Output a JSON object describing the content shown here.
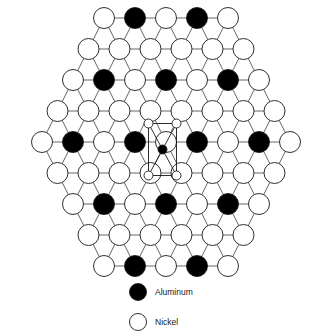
{
  "figure": {
    "background_color": "#ffffff",
    "width": 332,
    "height": 336
  },
  "colors": {
    "aluminum_fill": "#000000",
    "nickel_fill": "#ffffff",
    "atom_stroke": "#1a1a1a",
    "bond_stroke": "#555555",
    "unit_cell_stroke": "#1a1a1a"
  },
  "lattice": {
    "geometry": {
      "center_x": 166,
      "center_y": 142,
      "column_spacing": 31,
      "row_spacing": 31,
      "atom_radius": 10.5,
      "bond_width": 0.9,
      "atom_stroke_width": 0.9
    },
    "legend_keys": {
      "aluminum": "Al",
      "nickel": "Ni"
    },
    "rows": [
      {
        "index": 0,
        "y": 18,
        "offset": 0.0,
        "count": 5,
        "species": [
          "Ni",
          "Al",
          "Ni",
          "Al",
          "Ni"
        ]
      },
      {
        "index": 1,
        "y": 49,
        "offset": 0.5,
        "count": 6,
        "species": [
          "Ni",
          "Ni",
          "Ni",
          "Ni",
          "Ni",
          "Ni"
        ]
      },
      {
        "index": 2,
        "y": 80,
        "offset": 0.0,
        "count": 7,
        "species": [
          "Ni",
          "Al",
          "Ni",
          "Al",
          "Ni",
          "Al",
          "Ni"
        ]
      },
      {
        "index": 3,
        "y": 111,
        "offset": 0.5,
        "count": 8,
        "species": [
          "Ni",
          "Ni",
          "Ni",
          "Ni",
          "Ni",
          "Ni",
          "Ni",
          "Ni"
        ]
      },
      {
        "index": 4,
        "y": 142,
        "offset": 0.0,
        "count": 9,
        "species": [
          "Ni",
          "Al",
          "Ni",
          "Al",
          "Ni",
          "Al",
          "Ni",
          "Al",
          "Ni"
        ]
      },
      {
        "index": 5,
        "y": 173,
        "offset": 0.5,
        "count": 8,
        "species": [
          "Ni",
          "Ni",
          "Ni",
          "Ni",
          "Ni",
          "Ni",
          "Ni",
          "Ni"
        ]
      },
      {
        "index": 6,
        "y": 204,
        "offset": 0.0,
        "count": 7,
        "species": [
          "Ni",
          "Al",
          "Ni",
          "Al",
          "Ni",
          "Al",
          "Ni"
        ]
      },
      {
        "index": 7,
        "y": 235,
        "offset": 0.5,
        "count": 6,
        "species": [
          "Ni",
          "Ni",
          "Ni",
          "Ni",
          "Ni",
          "Ni"
        ]
      },
      {
        "index": 8,
        "y": 266,
        "offset": 0.0,
        "count": 5,
        "species": [
          "Ni",
          "Al",
          "Ni",
          "Al",
          "Ni"
        ]
      }
    ]
  },
  "unit_cell": {
    "label": "unit cell",
    "x": 148.5,
    "y": 123.5,
    "width": 28,
    "height": 52,
    "stroke_width": 0.9,
    "corner_marker_radius": 4.5,
    "corner_marker_fill": "#ffffff",
    "center_marker_radius": 4.5,
    "center_marker_fill": "#000000",
    "center_x": 162.5,
    "center_y": 149.5,
    "diagonals": true
  },
  "legend": {
    "items": [
      {
        "label": "Aluminum",
        "species": "Al",
        "fill": "#000000",
        "swatch_cx": 138,
        "swatch_cy": 292,
        "text_x": 155,
        "text_y": 295
      },
      {
        "label": "Nickel",
        "species": "Ni",
        "fill": "#ffffff",
        "swatch_cx": 138,
        "swatch_cy": 322,
        "text_x": 155,
        "text_y": 325
      }
    ],
    "swatch_radius": 8.5,
    "swatch_stroke": "#1a1a1a",
    "font_size": 8.5
  }
}
